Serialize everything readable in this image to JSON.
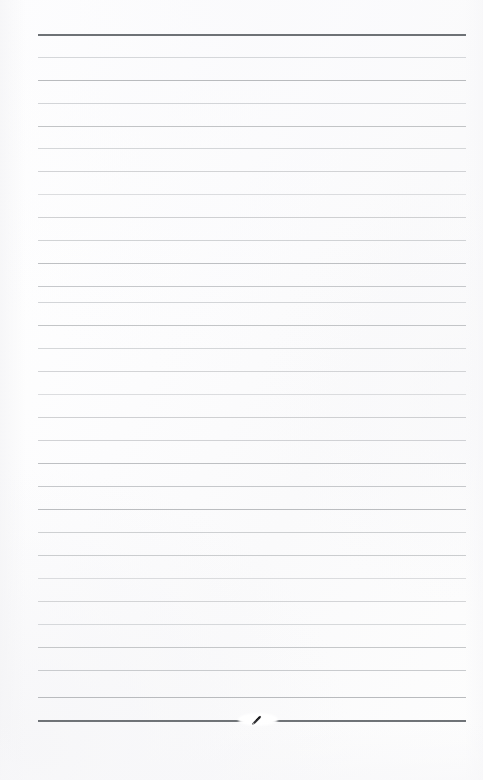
{
  "document": {
    "kind": "scanned-lined-notepad-page",
    "title": "Blank ruled notepad page",
    "background_color": "#fdfdfd",
    "page_width": 483,
    "page_height": 780,
    "content_text": "",
    "rule_color": "#b9bbbe",
    "rule_color_soft": "#c6c8cb",
    "rule_color_faint": "#d2d4d7",
    "rule_emphasis_color": "#6e7276",
    "ink_mark_color": "#2b2b2d"
  },
  "ruling": {
    "line_left_x": 38,
    "line_right_x": 466,
    "line_width": 428,
    "first_line_y": 34,
    "line_spacing": 22.9,
    "line_count": 31,
    "lines": [
      {
        "y": 34,
        "weight": "emphasis"
      },
      {
        "y": 57,
        "weight": "faint"
      },
      {
        "y": 80,
        "weight": "normal"
      },
      {
        "y": 103,
        "weight": "faint"
      },
      {
        "y": 126,
        "weight": "normal"
      },
      {
        "y": 148,
        "weight": "soft"
      },
      {
        "y": 171,
        "weight": "normal"
      },
      {
        "y": 194,
        "weight": "soft"
      },
      {
        "y": 217,
        "weight": "normal"
      },
      {
        "y": 240,
        "weight": "soft"
      },
      {
        "y": 263,
        "weight": "normal"
      },
      {
        "y": 286,
        "weight": "soft"
      },
      {
        "y": 302,
        "weight": "faint"
      },
      {
        "y": 325,
        "weight": "normal"
      },
      {
        "y": 348,
        "weight": "soft"
      },
      {
        "y": 371,
        "weight": "normal"
      },
      {
        "y": 394,
        "weight": "soft"
      },
      {
        "y": 417,
        "weight": "normal"
      },
      {
        "y": 440,
        "weight": "soft"
      },
      {
        "y": 463,
        "weight": "normal"
      },
      {
        "y": 486,
        "weight": "soft"
      },
      {
        "y": 509,
        "weight": "normal"
      },
      {
        "y": 532,
        "weight": "soft"
      },
      {
        "y": 555,
        "weight": "normal"
      },
      {
        "y": 578,
        "weight": "soft"
      },
      {
        "y": 601,
        "weight": "normal"
      },
      {
        "y": 624,
        "weight": "soft"
      },
      {
        "y": 647,
        "weight": "normal"
      },
      {
        "y": 670,
        "weight": "soft"
      },
      {
        "y": 697,
        "weight": "normal"
      },
      {
        "y": 720,
        "weight": "emphasis"
      }
    ]
  },
  "annotations": {
    "ink_mark": {
      "label": "stray pen mark",
      "x": 258,
      "y": 720,
      "width": 14,
      "height": 8
    }
  }
}
